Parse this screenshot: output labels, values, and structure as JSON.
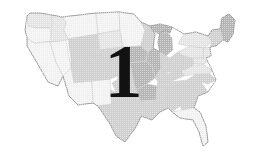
{
  "figure": {
    "kind": "map-figure",
    "background_color": "#ffffff",
    "overlay_number": "1",
    "overlay_number_color": "#121212",
    "rendering": "halftone grayscale scan"
  },
  "palette": {
    "outline": "#9a9a9a",
    "state_border": "#c9c9c9",
    "fill_light": "#f2f2f2",
    "fill_pale": "#e4e4e4",
    "fill_mid": "#cfcfcf",
    "fill_dark": "#b4b4b4",
    "fill_darkest": "#a2a2a2",
    "water": "#ffffff"
  },
  "regions": [
    {
      "name": "Washington",
      "tone": "fill_pale"
    },
    {
      "name": "Oregon",
      "tone": "fill_light"
    },
    {
      "name": "California",
      "tone": "fill_light"
    },
    {
      "name": "Nevada",
      "tone": "fill_light"
    },
    {
      "name": "Idaho",
      "tone": "fill_pale"
    },
    {
      "name": "Montana",
      "tone": "fill_light"
    },
    {
      "name": "Wyoming",
      "tone": "fill_mid"
    },
    {
      "name": "Utah",
      "tone": "fill_mid"
    },
    {
      "name": "Arizona",
      "tone": "fill_light"
    },
    {
      "name": "New Mexico",
      "tone": "fill_light"
    },
    {
      "name": "Colorado",
      "tone": "fill_mid"
    },
    {
      "name": "North Dakota",
      "tone": "fill_light"
    },
    {
      "name": "South Dakota",
      "tone": "fill_pale"
    },
    {
      "name": "Nebraska",
      "tone": "fill_mid"
    },
    {
      "name": "Kansas",
      "tone": "fill_mid"
    },
    {
      "name": "Oklahoma",
      "tone": "fill_mid"
    },
    {
      "name": "Texas",
      "tone": "fill_mid"
    },
    {
      "name": "Minnesota",
      "tone": "fill_light"
    },
    {
      "name": "Iowa",
      "tone": "fill_dark"
    },
    {
      "name": "Missouri",
      "tone": "fill_dark"
    },
    {
      "name": "Arkansas",
      "tone": "fill_dark"
    },
    {
      "name": "Louisiana",
      "tone": "fill_mid"
    },
    {
      "name": "Wisconsin",
      "tone": "fill_mid"
    },
    {
      "name": "Illinois",
      "tone": "fill_dark"
    },
    {
      "name": "Michigan",
      "tone": "fill_dark"
    },
    {
      "name": "Indiana",
      "tone": "fill_mid"
    },
    {
      "name": "Ohio",
      "tone": "fill_mid"
    },
    {
      "name": "Kentucky",
      "tone": "fill_mid"
    },
    {
      "name": "Tennessee",
      "tone": "fill_mid"
    },
    {
      "name": "Mississippi",
      "tone": "fill_mid"
    },
    {
      "name": "Alabama",
      "tone": "fill_mid"
    },
    {
      "name": "Georgia",
      "tone": "fill_mid"
    },
    {
      "name": "Florida",
      "tone": "fill_light"
    },
    {
      "name": "South Carolina",
      "tone": "fill_mid"
    },
    {
      "name": "North Carolina",
      "tone": "fill_mid"
    },
    {
      "name": "Virginia",
      "tone": "fill_pale"
    },
    {
      "name": "West Virginia",
      "tone": "fill_mid"
    },
    {
      "name": "Maryland",
      "tone": "fill_pale"
    },
    {
      "name": "Pennsylvania",
      "tone": "fill_pale"
    },
    {
      "name": "New York",
      "tone": "fill_pale"
    },
    {
      "name": "New Jersey",
      "tone": "fill_pale"
    },
    {
      "name": "New England",
      "tone": "fill_mid"
    },
    {
      "name": "Maine",
      "tone": "fill_dark"
    }
  ]
}
